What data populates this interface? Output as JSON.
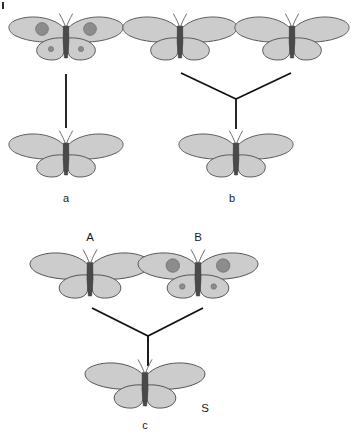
{
  "figure": {
    "title_visible": false,
    "background_color": "#ffffff",
    "panels": [
      {
        "id": "a",
        "label": "a",
        "label_position": {
          "x": 66,
          "y": 202
        },
        "description": "single spotted parent above plain offspring joined by a vertical line",
        "parents": [
          {
            "name": "parent-spotted",
            "label": "",
            "spotted": true,
            "position": {
              "x": 66,
              "y": 38
            },
            "scale": 1.0
          }
        ],
        "offspring": [
          {
            "name": "offspring-plain",
            "label": "",
            "spotted": false,
            "position": {
              "x": 66,
              "y": 155
            },
            "scale": 1.0
          }
        ],
        "connector": {
          "type": "vertical-line",
          "points": [
            [
              66,
              74
            ],
            [
              66,
              128
            ]
          ]
        }
      },
      {
        "id": "b",
        "label": "b",
        "label_position": {
          "x": 232,
          "y": 202
        },
        "description": "two plain parents joined by a Y connector to a plain offspring",
        "parents": [
          {
            "name": "parent-plain-left",
            "label": "",
            "spotted": false,
            "position": {
              "x": 180,
              "y": 38
            },
            "scale": 1.0
          },
          {
            "name": "parent-plain-right",
            "label": "",
            "spotted": false,
            "position": {
              "x": 292,
              "y": 38
            },
            "scale": 1.0
          }
        ],
        "offspring": [
          {
            "name": "offspring-plain",
            "label": "",
            "spotted": false,
            "position": {
              "x": 236,
              "y": 155
            },
            "scale": 1.0
          }
        ],
        "connector": {
          "type": "y-connector",
          "left_arm": [
            [
              181,
              73
            ],
            [
              236,
              99
            ]
          ],
          "right_arm": [
            [
              291,
              73
            ],
            [
              236,
              99
            ]
          ],
          "stem": [
            [
              236,
              99
            ],
            [
              236,
              129
            ]
          ]
        }
      },
      {
        "id": "c",
        "label": "c",
        "label_position": {
          "x": 145,
          "y": 429
        },
        "description": "plain parent A crossed with spotted parent B producing plain offspring S",
        "parents": [
          {
            "name": "parent-a",
            "label": "A",
            "label_position": {
              "x": 90,
              "y": 241
            },
            "spotted": false,
            "position": {
              "x": 90,
              "y": 275
            },
            "scale": 1.05
          },
          {
            "name": "parent-b",
            "label": "B",
            "label_position": {
              "x": 198,
              "y": 241
            },
            "spotted": true,
            "position": {
              "x": 198,
              "y": 275
            },
            "scale": 1.05
          }
        ],
        "offspring": [
          {
            "name": "offspring-s",
            "label": "S",
            "label_position": {
              "x": 205,
              "y": 412
            },
            "spotted": false,
            "position": {
              "x": 145,
              "y": 385
            },
            "scale": 1.05
          }
        ],
        "connector": {
          "type": "y-connector",
          "left_arm": [
            [
              92,
              308
            ],
            [
              148,
              336
            ]
          ],
          "right_arm": [
            [
              203,
              308
            ],
            [
              148,
              336
            ]
          ],
          "stem": [
            [
              148,
              336
            ],
            [
              148,
              366
            ]
          ]
        }
      }
    ],
    "colors": {
      "wing_fill": "#cccccc",
      "wing_stroke": "#4d4d4d",
      "body_fill": "#4a4a4a",
      "spot_fill": "#8c8c8c",
      "antenna_stroke": "#5a5a5a",
      "line_stroke": "#111111",
      "label_color": "#1a1a1a"
    },
    "corner_mark": {
      "name": "corner-artifact",
      "x": 2,
      "y": 2,
      "width": 2,
      "height": 7,
      "color": "#2b2b2b"
    }
  }
}
